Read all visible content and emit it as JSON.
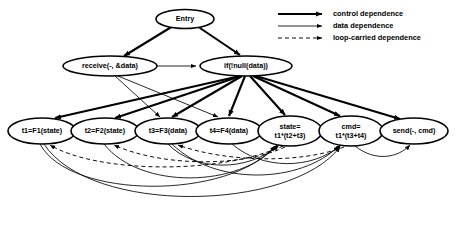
{
  "diagram": {
    "background_color": "#ffffff",
    "stroke_color": "#000000"
  },
  "nodes": [
    {
      "id": "entry",
      "label": "Entry",
      "label2": "",
      "cx": 185,
      "cy": 19,
      "rx": 29,
      "ry": 9.5
    },
    {
      "id": "receive",
      "label": "receive(-, &data)",
      "label2": "",
      "cx": 110,
      "cy": 66,
      "rx": 47,
      "ry": 10
    },
    {
      "id": "if",
      "label": "if(!null(data))",
      "label2": "",
      "cx": 246,
      "cy": 66,
      "rx": 46,
      "ry": 10
    },
    {
      "id": "t1",
      "label": "t1=F1(state)",
      "label2": "",
      "cx": 42,
      "cy": 131,
      "rx": 34,
      "ry": 13
    },
    {
      "id": "t2",
      "label": "t2=F2(state)",
      "label2": "",
      "cx": 105,
      "cy": 131,
      "rx": 34,
      "ry": 13
    },
    {
      "id": "t3",
      "label": "t3=F3(data)",
      "label2": "",
      "cx": 168,
      "cy": 131,
      "rx": 33,
      "ry": 13
    },
    {
      "id": "t4",
      "label": "t4=F4(data)",
      "label2": "",
      "cx": 229,
      "cy": 131,
      "rx": 33,
      "ry": 13
    },
    {
      "id": "state",
      "label": "state=",
      "label2": "t1*(t2+t3)",
      "cx": 290,
      "cy": 131,
      "rx": 32,
      "ry": 15
    },
    {
      "id": "cmd",
      "label": "cmd=",
      "label2": "t1*(t3+t4)",
      "cx": 351,
      "cy": 131,
      "rx": 32,
      "ry": 15
    },
    {
      "id": "send",
      "label": "send(-, cmd)",
      "label2": "",
      "cx": 414,
      "cy": 131,
      "rx": 34,
      "ry": 13
    }
  ],
  "legend": {
    "items": [
      {
        "label": "control dependence",
        "style": "control",
        "y": 14
      },
      {
        "label": "data dependence",
        "style": "data",
        "y": 26
      },
      {
        "label": "loop-carried dependence",
        "style": "loop",
        "y": 38
      }
    ],
    "line_x_start": 278,
    "line_x_end": 322,
    "label_x": 333
  },
  "edges": {
    "control": [
      {
        "from": "entry",
        "to": "receive"
      },
      {
        "from": "entry",
        "to": "if"
      },
      {
        "from": "if",
        "to": "t1"
      },
      {
        "from": "if",
        "to": "t2"
      },
      {
        "from": "if",
        "to": "t3"
      },
      {
        "from": "if",
        "to": "t4"
      },
      {
        "from": "if",
        "to": "state"
      },
      {
        "from": "if",
        "to": "cmd"
      },
      {
        "from": "if",
        "to": "send"
      }
    ],
    "data": [
      {
        "from": "receive",
        "to": "if"
      },
      {
        "from": "receive",
        "to": "t3"
      },
      {
        "from": "receive",
        "to": "t4"
      },
      {
        "from": "t1",
        "to": "state"
      },
      {
        "from": "t2",
        "to": "state"
      },
      {
        "from": "t3",
        "to": "state"
      },
      {
        "from": "t1",
        "to": "cmd"
      },
      {
        "from": "t3",
        "to": "cmd"
      },
      {
        "from": "t4",
        "to": "cmd"
      },
      {
        "from": "cmd",
        "to": "send"
      }
    ],
    "loop_carried": [
      {
        "from": "state",
        "to": "t1"
      },
      {
        "from": "state",
        "to": "t2"
      },
      {
        "from": "cmd",
        "to": "t3"
      }
    ]
  }
}
